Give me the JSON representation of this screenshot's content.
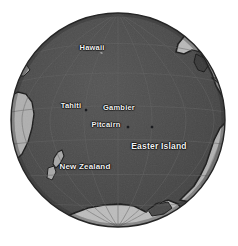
{
  "figure": {
    "projection": "orthographic",
    "background_color": "#ffffff",
    "ocean_color": "#4a4a4a",
    "land_color": "#b9b9b9",
    "coast_color": "#1b1b1b",
    "graticule_color": "#5d5d5d",
    "label_color": "#f2f2f2",
    "dot_color": "#14161a",
    "globe": {
      "center_x": 118,
      "center_y": 120,
      "radius": 107
    }
  },
  "labels": [
    {
      "name": "Hawaii",
      "text": "Hawaii",
      "x": 92,
      "y": 47,
      "font_size": "7.5px",
      "dot_x": null,
      "dot_y": null
    },
    {
      "name": "Tahiti",
      "text": "Tahiti",
      "x": 71,
      "y": 105,
      "font_size": "7.5px",
      "dot_x": 86,
      "dot_y": 110
    },
    {
      "name": "Gambier",
      "text": "Gambier",
      "x": 119,
      "y": 107,
      "font_size": "7.5px",
      "dot_x": null,
      "dot_y": null
    },
    {
      "name": "Pitcairn",
      "text": "Pitcairn",
      "x": 106,
      "y": 124,
      "font_size": "7.5px",
      "dot_x": 128,
      "dot_y": 127
    },
    {
      "name": "Easter Island",
      "text": "Easter Island",
      "x": 159,
      "y": 146,
      "font_size": "8.5px",
      "dot_x": 152,
      "dot_y": 127
    },
    {
      "name": "New Zealand",
      "text": "New Zealand",
      "x": 85,
      "y": 166,
      "font_size": "8px",
      "dot_x": null,
      "dot_y": null
    }
  ],
  "graticule": {
    "meridian_spacing_deg": 20,
    "parallel_spacing_deg": 20,
    "visible": true
  },
  "landmasses": [
    {
      "name": "north-central-america",
      "position": "upper-right"
    },
    {
      "name": "south-america",
      "position": "right"
    },
    {
      "name": "antarctica",
      "position": "bottom"
    },
    {
      "name": "new-zealand",
      "position": "lower-left"
    },
    {
      "name": "australia-edge",
      "position": "left"
    }
  ]
}
